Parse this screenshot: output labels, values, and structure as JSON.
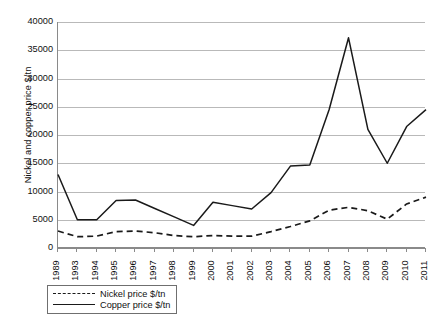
{
  "chart_data": {
    "type": "line",
    "title": "",
    "xlabel": "",
    "ylabel": "Nickel and copper price $/tn",
    "categories": [
      "1989",
      "1993",
      "1994",
      "1995",
      "1996",
      "1997",
      "1998",
      "1999",
      "2000",
      "2001",
      "2002",
      "2003",
      "2004",
      "2005",
      "2006",
      "2007",
      "2008",
      "2009",
      "2010",
      "2011"
    ],
    "ylim": [
      0,
      40000
    ],
    "ytick_step": 5000,
    "yticks": [
      0,
      5000,
      10000,
      15000,
      20000,
      25000,
      30000,
      35000,
      40000
    ],
    "ytick_labels": [
      "0",
      "5000",
      "10000",
      "15000",
      "20000",
      "25000",
      "30000",
      "35000",
      "40000"
    ],
    "grid": true,
    "grid_axis": "y",
    "legend_position": "below-left",
    "series": [
      {
        "name": "Nickel price $/tn",
        "style": "dashed",
        "color": "#1a1a1a",
        "values": [
          3000,
          2000,
          2100,
          2900,
          3000,
          2700,
          2200,
          2000,
          2200,
          2100,
          2100,
          2900,
          3800,
          4800,
          6700,
          7200,
          6600,
          5100,
          7800,
          9000
        ]
      },
      {
        "name": "Copper price $/tn",
        "style": "solid",
        "color": "#1a1a1a",
        "values": [
          13000,
          5000,
          5000,
          8400,
          8500,
          7000,
          5500,
          4000,
          8100,
          7500,
          6900,
          9800,
          14500,
          14700,
          24500,
          37200,
          21000,
          15000,
          21500,
          24500
        ]
      }
    ]
  },
  "legend": {
    "items": [
      {
        "label": "Nickel price $/tn",
        "style": "dashed"
      },
      {
        "label": "Copper price $/tn",
        "style": "solid"
      }
    ]
  },
  "caption_fragment": ""
}
